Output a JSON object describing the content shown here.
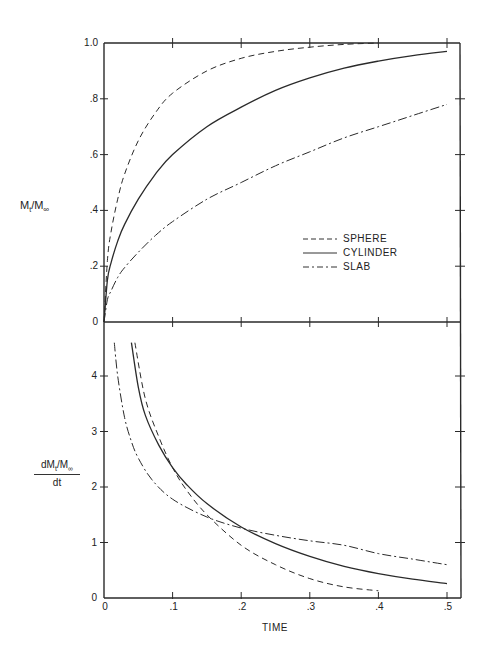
{
  "chart_data": [
    {
      "type": "line",
      "title": "",
      "xlabel": "",
      "ylabel": "Mt/M∞",
      "xlim": [
        0,
        0.5
      ],
      "ylim": [
        0,
        1.0
      ],
      "y_ticks": [
        "0",
        ".2",
        ".4",
        ".6",
        ".8",
        "1.0"
      ],
      "grid": false,
      "legend_position": "inside right-middle",
      "series": [
        {
          "name": "SPHERE",
          "style": "dashed",
          "x": [
            0,
            0.005,
            0.01,
            0.02,
            0.03,
            0.05,
            0.075,
            0.1,
            0.15,
            0.2,
            0.25,
            0.3,
            0.35,
            0.4
          ],
          "y": [
            0,
            0.22,
            0.32,
            0.44,
            0.53,
            0.65,
            0.75,
            0.82,
            0.9,
            0.945,
            0.97,
            0.985,
            0.995,
            1.0
          ]
        },
        {
          "name": "CYLINDER",
          "style": "solid",
          "x": [
            0,
            0.005,
            0.01,
            0.02,
            0.03,
            0.05,
            0.075,
            0.1,
            0.15,
            0.2,
            0.25,
            0.3,
            0.35,
            0.4,
            0.45,
            0.5
          ],
          "y": [
            0,
            0.15,
            0.21,
            0.29,
            0.35,
            0.44,
            0.53,
            0.6,
            0.7,
            0.77,
            0.83,
            0.875,
            0.91,
            0.935,
            0.955,
            0.97
          ]
        },
        {
          "name": "SLAB",
          "style": "dash-dot",
          "x": [
            0,
            0.005,
            0.01,
            0.02,
            0.03,
            0.05,
            0.075,
            0.1,
            0.15,
            0.2,
            0.25,
            0.3,
            0.35,
            0.4,
            0.45,
            0.5
          ],
          "y": [
            0,
            0.08,
            0.11,
            0.16,
            0.195,
            0.25,
            0.31,
            0.36,
            0.44,
            0.5,
            0.56,
            0.61,
            0.66,
            0.7,
            0.74,
            0.78
          ]
        }
      ]
    },
    {
      "type": "line",
      "title": "",
      "xlabel": "TIME",
      "ylabel": "dMt/M∞ / dt",
      "xlim": [
        0,
        0.5
      ],
      "ylim": [
        0,
        4.8
      ],
      "x_ticks": [
        "0",
        ".1",
        ".2",
        ".3",
        ".4",
        ".5"
      ],
      "y_ticks": [
        "0",
        "1",
        "2",
        "3",
        "4"
      ],
      "grid": false,
      "series": [
        {
          "name": "SPHERE",
          "style": "dashed",
          "x": [
            0.045,
            0.06,
            0.08,
            0.1,
            0.12,
            0.15,
            0.2,
            0.25,
            0.3,
            0.35,
            0.4
          ],
          "y": [
            4.6,
            3.6,
            2.9,
            2.35,
            1.95,
            1.5,
            0.95,
            0.6,
            0.35,
            0.2,
            0.13
          ]
        },
        {
          "name": "CYLINDER",
          "style": "solid",
          "x": [
            0.04,
            0.05,
            0.06,
            0.08,
            0.1,
            0.12,
            0.15,
            0.2,
            0.25,
            0.3,
            0.35,
            0.4,
            0.45,
            0.5
          ],
          "y": [
            4.6,
            3.8,
            3.3,
            2.75,
            2.35,
            2.05,
            1.7,
            1.28,
            0.98,
            0.75,
            0.57,
            0.44,
            0.34,
            0.26
          ]
        },
        {
          "name": "SLAB",
          "style": "dash-dot",
          "x": [
            0.015,
            0.02,
            0.03,
            0.04,
            0.05,
            0.07,
            0.1,
            0.15,
            0.2,
            0.25,
            0.3,
            0.35,
            0.4,
            0.45,
            0.5
          ],
          "y": [
            4.6,
            4.0,
            3.25,
            2.82,
            2.52,
            2.13,
            1.78,
            1.46,
            1.26,
            1.13,
            1.03,
            0.95,
            0.8,
            0.7,
            0.6
          ]
        }
      ]
    }
  ],
  "top": {
    "y_label_main": "M",
    "y_label_sub1": "t",
    "y_label_slash": "/M",
    "y_label_sub2": "∞",
    "y_ticks": [
      {
        "label": "1.0",
        "v": 1.0
      },
      {
        "label": ".8",
        "v": 0.8
      },
      {
        "label": ".6",
        "v": 0.6
      },
      {
        "label": ".4",
        "v": 0.4
      },
      {
        "label": ".2",
        "v": 0.2
      },
      {
        "label": "0",
        "v": 0
      }
    ]
  },
  "bottom": {
    "y_label_num": "dM",
    "y_label_sub1": "t",
    "y_label_slash": "/M",
    "y_label_sub2": "∞",
    "y_label_den": "dt",
    "y_ticks": [
      {
        "label": "4",
        "v": 4
      },
      {
        "label": "3",
        "v": 3
      },
      {
        "label": "2",
        "v": 2
      },
      {
        "label": "1",
        "v": 1
      },
      {
        "label": "0",
        "v": 0
      }
    ],
    "x_ticks": [
      {
        "label": "0",
        "v": 0
      },
      {
        "label": ".1",
        "v": 0.1
      },
      {
        "label": ".2",
        "v": 0.2
      },
      {
        "label": ".3",
        "v": 0.3
      },
      {
        "label": ".4",
        "v": 0.4
      },
      {
        "label": ".5",
        "v": 0.5
      }
    ],
    "x_label": "TIME"
  },
  "legend": {
    "items": [
      {
        "label": "SPHERE",
        "style": "dashed"
      },
      {
        "label": "CYLINDER",
        "style": "solid"
      },
      {
        "label": "SLAB",
        "style": "dash-dot"
      }
    ]
  }
}
